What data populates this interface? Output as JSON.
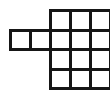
{
  "figure": {
    "name": "polyomino-grid-figure",
    "cell_count": 14,
    "line_color": "#161616",
    "fill_color": "#ffffff",
    "background_color": "#ffffff",
    "stroke_width": 3,
    "cell_width": 20,
    "cell_height": 19.5,
    "origin_x": 10.5,
    "origin_y": 10.5,
    "main_block": {
      "name": "main-grid-block",
      "columns": 3,
      "rows": 4,
      "col_start": 2,
      "row_start": 0
    },
    "arm_block": {
      "name": "left-arm-block",
      "columns": 2,
      "rows": 1,
      "col_start": 0,
      "row_start": 1
    },
    "cells": [
      {
        "col": 2,
        "row": 0
      },
      {
        "col": 3,
        "row": 0
      },
      {
        "col": 4,
        "row": 0
      },
      {
        "col": 0,
        "row": 1
      },
      {
        "col": 1,
        "row": 1
      },
      {
        "col": 2,
        "row": 1
      },
      {
        "col": 3,
        "row": 1
      },
      {
        "col": 4,
        "row": 1
      },
      {
        "col": 2,
        "row": 2
      },
      {
        "col": 3,
        "row": 2
      },
      {
        "col": 4,
        "row": 2
      },
      {
        "col": 2,
        "row": 3
      },
      {
        "col": 3,
        "row": 3
      },
      {
        "col": 4,
        "row": 3
      }
    ]
  }
}
